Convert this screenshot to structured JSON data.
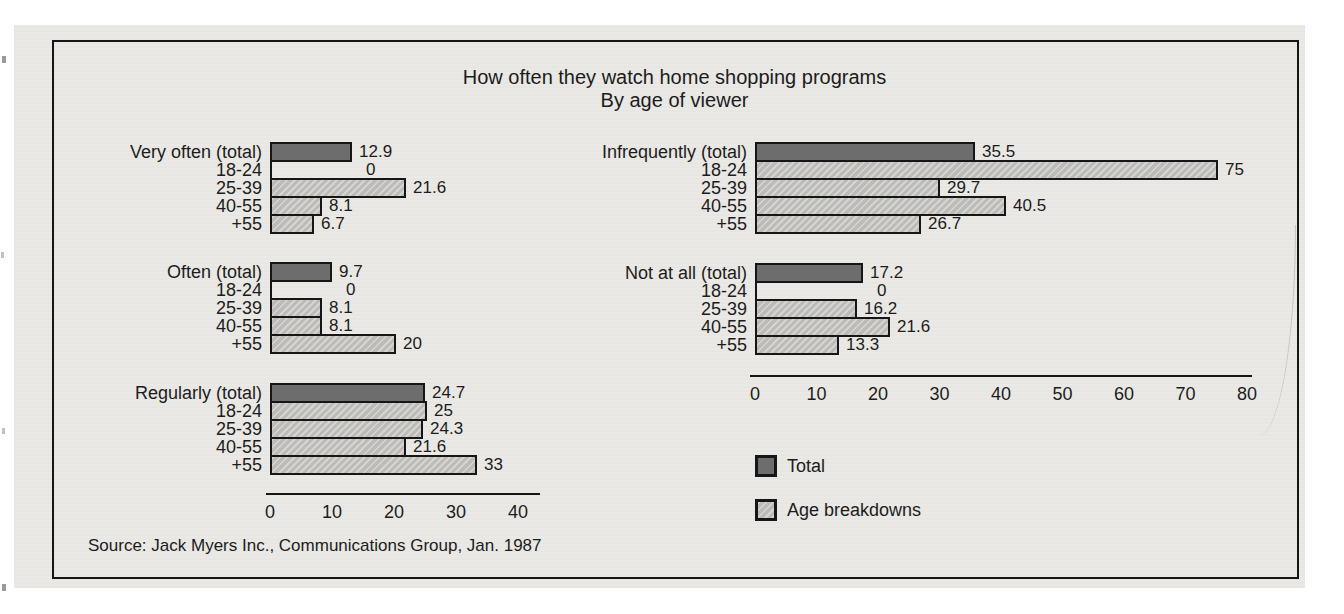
{
  "chart_data": {
    "type": "bar",
    "orientation": "horizontal",
    "title": "How often they watch home shopping programs",
    "subtitle": "By age of viewer",
    "source": "Source: Jack Myers Inc., Communications Group, Jan. 1987",
    "age_categories": [
      "18-24",
      "25-39",
      "40-55",
      "+55"
    ],
    "legend": [
      {
        "label": "Total",
        "swatch": "dark"
      },
      {
        "label": "Age breakdowns",
        "swatch": "light"
      }
    ],
    "colors": {
      "total_bar": "#6d6d6d",
      "age_bar": "#c4c3bf",
      "outline": "#161616",
      "paper": "#eae9e5"
    },
    "panels": [
      {
        "side": "left",
        "xlim": [
          0,
          40
        ],
        "tick_values": [
          0,
          10,
          20,
          30,
          40
        ],
        "groups": [
          {
            "name": "Very often",
            "rows": [
              {
                "label": "Very often (total)",
                "series": "total",
                "value": 12.9
              },
              {
                "label": "18-24",
                "series": "age",
                "value": 0
              },
              {
                "label": "25-39",
                "series": "age",
                "value": 21.6
              },
              {
                "label": "40-55",
                "series": "age",
                "value": 8.1
              },
              {
                "label": "+55",
                "series": "age",
                "value": 6.7
              }
            ]
          },
          {
            "name": "Often",
            "rows": [
              {
                "label": "Often (total)",
                "series": "total",
                "value": 9.7
              },
              {
                "label": "18-24",
                "series": "age",
                "value": 0
              },
              {
                "label": "25-39",
                "series": "age",
                "value": 8.1
              },
              {
                "label": "40-55",
                "series": "age",
                "value": 8.1
              },
              {
                "label": "+55",
                "series": "age",
                "value": 20
              }
            ]
          },
          {
            "name": "Regularly",
            "rows": [
              {
                "label": "Regularly (total)",
                "series": "total",
                "value": 24.7
              },
              {
                "label": "18-24",
                "series": "age",
                "value": 25
              },
              {
                "label": "25-39",
                "series": "age",
                "value": 24.3
              },
              {
                "label": "40-55",
                "series": "age",
                "value": 21.6
              },
              {
                "label": "+55",
                "series": "age",
                "value": 33
              }
            ]
          }
        ]
      },
      {
        "side": "right",
        "xlim": [
          0,
          80
        ],
        "tick_values": [
          0,
          10,
          20,
          30,
          40,
          50,
          60,
          70,
          80
        ],
        "groups": [
          {
            "name": "Infrequently",
            "rows": [
              {
                "label": "Infrequently (total)",
                "series": "total",
                "value": 35.5
              },
              {
                "label": "18-24",
                "series": "age",
                "value": 75
              },
              {
                "label": "25-39",
                "series": "age",
                "value": 29.7
              },
              {
                "label": "40-55",
                "series": "age",
                "value": 40.5
              },
              {
                "label": "+55",
                "series": "age",
                "value": 26.7
              }
            ]
          },
          {
            "name": "Not at all",
            "rows": [
              {
                "label": "Not at all (total)",
                "series": "total",
                "value": 17.2
              },
              {
                "label": "18-24",
                "series": "age",
                "value": 0
              },
              {
                "label": "25-39",
                "series": "age",
                "value": 16.2
              },
              {
                "label": "40-55",
                "series": "age",
                "value": 21.6
              },
              {
                "label": "+55",
                "series": "age",
                "value": 13.3
              }
            ]
          }
        ]
      }
    ]
  }
}
